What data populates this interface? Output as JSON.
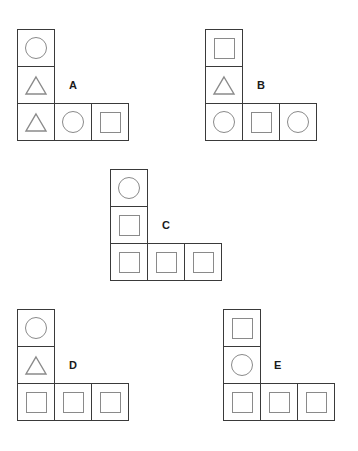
{
  "page": {
    "background_color": "#ffffff",
    "cell_border_color": "#3a3a3a",
    "shape_stroke_color": "#8a8a8a",
    "label_color": "#1a1a1a"
  },
  "figures": [
    {
      "label": "A",
      "label_x": 69,
      "label_y": 80,
      "x": 18,
      "y": 30,
      "column": [
        "circle",
        "triangle"
      ],
      "bottom_row": [
        "triangle",
        "circle",
        "square"
      ]
    },
    {
      "label": "B",
      "label_x": 257,
      "label_y": 80,
      "x": 206,
      "y": 30,
      "column": [
        "square",
        "triangle"
      ],
      "bottom_row": [
        "circle",
        "square",
        "circle"
      ]
    },
    {
      "label": "C",
      "label_x": 162,
      "label_y": 220,
      "x": 111,
      "y": 170,
      "column": [
        "circle",
        "square"
      ],
      "bottom_row": [
        "square",
        "square",
        "square"
      ]
    },
    {
      "label": "D",
      "label_x": 69,
      "label_y": 360,
      "x": 18,
      "y": 310,
      "column": [
        "circle",
        "triangle"
      ],
      "bottom_row": [
        "square",
        "square",
        "square"
      ]
    },
    {
      "label": "E",
      "label_x": 274,
      "label_y": 360,
      "x": 224,
      "y": 310,
      "column": [
        "square",
        "circle"
      ],
      "bottom_row": [
        "square",
        "square",
        "square"
      ]
    }
  ]
}
